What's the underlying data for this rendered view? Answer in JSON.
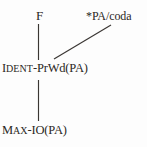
{
  "figure": {
    "type": "constraint-ranking-hasse-diagram",
    "background_color": "#fdfdfd",
    "ink_color": "#2b2724",
    "width": 147,
    "height": 147
  },
  "nodes": {
    "top_left": {
      "id": "F",
      "text": "F",
      "lead": "F",
      "rest": "",
      "x": 36,
      "y": 9
    },
    "top_right": {
      "id": "star-PA-coda",
      "text": "*PA/coda",
      "x": 86,
      "y": 10
    },
    "middle": {
      "id": "IDENT-PrWd(PA)",
      "text": "IDENT-PrWd(PA)",
      "lead": "I",
      "rest": "DENT",
      "tail": "-PrWd(PA)",
      "x": 2,
      "y": 62
    },
    "bottom": {
      "id": "MAX-IO(PA)",
      "text": "MAX-IO(PA)",
      "lead": "M",
      "rest": "AX",
      "tail2_lead": "-IO",
      "tail": "(PA)",
      "x": 2,
      "y": 124
    }
  },
  "edges": [
    {
      "name": "edge-f-to-ident",
      "from": "F",
      "to": "IDENT-PrWd(PA)",
      "x1": 38.5,
      "y1": 24,
      "x2": 38.5,
      "y2": 60
    },
    {
      "name": "edge-pa-coda-to-ident",
      "from": "*PA/coda",
      "to": "IDENT-PrWd(PA)",
      "x1": 111,
      "y1": 25,
      "x2": 54,
      "y2": 59
    },
    {
      "name": "edge-ident-to-max",
      "from": "IDENT-PrWd(PA)",
      "to": "MAX-IO(PA)",
      "x1": 38.5,
      "y1": 80,
      "x2": 38.5,
      "y2": 121
    }
  ]
}
